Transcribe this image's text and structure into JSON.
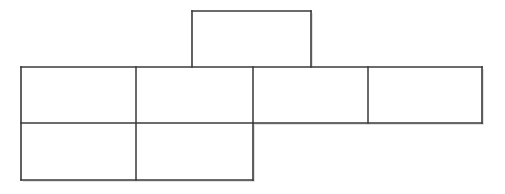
{
  "canvas": {
    "width": 505,
    "height": 194,
    "background_color": "#ffffff"
  },
  "diagram": {
    "name": "cube-net-unfolded-box",
    "type": "geometric-net",
    "face_count": 7,
    "stroke_color": "#3a3a3a",
    "stroke_width": 1.6,
    "fill_color": "#ffffff",
    "shadow_color": "#c8c8c8",
    "rows": [
      {
        "name": "top-row",
        "y_top": 11,
        "y_bottom": 67,
        "face_count": 1,
        "x_breaks": [
          192,
          311
        ]
      },
      {
        "name": "middle-row",
        "y_top": 67,
        "y_bottom": 123,
        "face_count": 4,
        "x_breaks": [
          21,
          136,
          253,
          368,
          482
        ]
      },
      {
        "name": "bottom-row",
        "y_top": 123,
        "y_bottom": 180,
        "face_count": 2,
        "x_breaks": [
          21,
          136,
          253
        ]
      }
    ],
    "faces": [
      {
        "id": "face-top-1",
        "row": "top-row",
        "x": 192,
        "y": 11,
        "width": 119,
        "height": 56,
        "label": ""
      },
      {
        "id": "face-middle-1",
        "row": "middle-row",
        "x": 21,
        "y": 67,
        "width": 115,
        "height": 56,
        "label": ""
      },
      {
        "id": "face-middle-2",
        "row": "middle-row",
        "x": 136,
        "y": 67,
        "width": 117,
        "height": 56,
        "label": ""
      },
      {
        "id": "face-middle-3",
        "row": "middle-row",
        "x": 253,
        "y": 67,
        "width": 115,
        "height": 56,
        "label": ""
      },
      {
        "id": "face-middle-4",
        "row": "middle-row",
        "x": 368,
        "y": 67,
        "width": 114,
        "height": 56,
        "label": ""
      },
      {
        "id": "face-bottom-1",
        "row": "bottom-row",
        "x": 21,
        "y": 123,
        "width": 115,
        "height": 57,
        "label": ""
      },
      {
        "id": "face-bottom-2",
        "row": "bottom-row",
        "x": 136,
        "y": 123,
        "width": 117,
        "height": 57,
        "label": ""
      }
    ],
    "edges": [
      {
        "id": "edge-top-rect-top",
        "x1": 192,
        "y1": 11,
        "x2": 311,
        "y2": 11,
        "kind": "outline"
      },
      {
        "id": "edge-top-rect-left",
        "x1": 192,
        "y1": 11,
        "x2": 192,
        "y2": 67,
        "kind": "outline"
      },
      {
        "id": "edge-top-rect-right",
        "x1": 311,
        "y1": 11,
        "x2": 311,
        "y2": 67,
        "kind": "outline"
      },
      {
        "id": "edge-middle-row-top",
        "x1": 21,
        "y1": 67,
        "x2": 482,
        "y2": 67,
        "kind": "outline"
      },
      {
        "id": "edge-middle-row-left",
        "x1": 21,
        "y1": 67,
        "x2": 21,
        "y2": 180,
        "kind": "outline"
      },
      {
        "id": "edge-middle-row-right",
        "x1": 482,
        "y1": 67,
        "x2": 482,
        "y2": 123,
        "kind": "outline"
      },
      {
        "id": "edge-middle-row-bottom-r",
        "x1": 253,
        "y1": 123,
        "x2": 482,
        "y2": 123,
        "kind": "outline"
      },
      {
        "id": "edge-horizontal-divider",
        "x1": 21,
        "y1": 123,
        "x2": 253,
        "y2": 123,
        "kind": "divider"
      },
      {
        "id": "edge-bottom-row-bottom",
        "x1": 21,
        "y1": 180,
        "x2": 253,
        "y2": 180,
        "kind": "outline"
      },
      {
        "id": "edge-bottom-row-right",
        "x1": 253,
        "y1": 123,
        "x2": 253,
        "y2": 180,
        "kind": "outline"
      },
      {
        "id": "edge-divider-v1",
        "x1": 136,
        "y1": 67,
        "x2": 136,
        "y2": 180,
        "kind": "divider"
      },
      {
        "id": "edge-divider-v2",
        "x1": 253,
        "y1": 67,
        "x2": 253,
        "y2": 123,
        "kind": "divider"
      },
      {
        "id": "edge-divider-v3",
        "x1": 368,
        "y1": 67,
        "x2": 368,
        "y2": 123,
        "kind": "divider"
      }
    ]
  }
}
